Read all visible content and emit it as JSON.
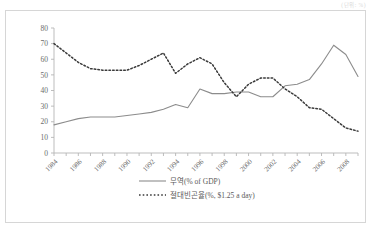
{
  "corner_note": "(단위: %)",
  "chart_data": {
    "type": "line",
    "title": "",
    "xlabel": "",
    "ylabel": "",
    "ylim": [
      0,
      80
    ],
    "ytick_values": [
      0,
      10,
      20,
      30,
      40,
      50,
      60,
      70,
      80
    ],
    "ytick_labels": [
      "0",
      "10",
      "20",
      "30",
      "40",
      "50",
      "60",
      "70",
      "80"
    ],
    "xlim": [
      1984,
      2009
    ],
    "x_all_years": [
      1984,
      1985,
      1986,
      1987,
      1988,
      1989,
      1990,
      1991,
      1992,
      1993,
      1994,
      1995,
      1996,
      1997,
      1998,
      1999,
      2000,
      2001,
      2002,
      2003,
      2004,
      2005,
      2006,
      2007,
      2008,
      2009
    ],
    "xtick_labels": [
      "1984",
      "1986",
      "1988",
      "1990",
      "1992",
      "1994",
      "1996",
      "1998",
      "2000",
      "2002",
      "2004",
      "2006",
      "2008"
    ],
    "xtick_years": [
      1984,
      1986,
      1988,
      1990,
      1992,
      1994,
      1996,
      1998,
      2000,
      2002,
      2004,
      2006,
      2008
    ],
    "grid": false,
    "legend_position": "bottom",
    "series": [
      {
        "name": "무역(% of GDP)",
        "style": "solid",
        "color": "#8c8c8c",
        "x": [
          1984,
          1985,
          1986,
          1987,
          1988,
          1989,
          1990,
          1991,
          1992,
          1993,
          1994,
          1995,
          1996,
          1997,
          1998,
          1999,
          2000,
          2001,
          2002,
          2003,
          2004,
          2005,
          2006,
          2007,
          2008,
          2009
        ],
        "values": [
          18,
          20,
          22,
          23,
          23,
          23,
          24,
          25,
          26,
          28,
          31,
          29,
          41,
          38,
          38,
          39,
          39,
          36,
          36,
          43,
          44,
          47,
          57,
          69,
          63,
          49
        ]
      },
      {
        "name": "절대빈곤율(%, $1.25 a day)",
        "style": "dotted",
        "color": "#3a3a3a",
        "x": [
          1984,
          1985,
          1986,
          1987,
          1988,
          1989,
          1990,
          1991,
          1992,
          1993,
          1994,
          1995,
          1996,
          1997,
          1998,
          1999,
          2000,
          2001,
          2002,
          2003,
          2004,
          2005,
          2006,
          2007,
          2008,
          2009
        ],
        "values": [
          70,
          64,
          58,
          54,
          53,
          53,
          53,
          56,
          60,
          64,
          51,
          57,
          61,
          57,
          45,
          36,
          44,
          48,
          48,
          41,
          36,
          29,
          28,
          22,
          16,
          14
        ]
      }
    ]
  },
  "legend": {
    "items": [
      {
        "label": "무역(% of GDP)",
        "style": "solid"
      },
      {
        "label": "절대빈곤율(%, $1.25 a day)",
        "style": "dotted"
      }
    ]
  }
}
